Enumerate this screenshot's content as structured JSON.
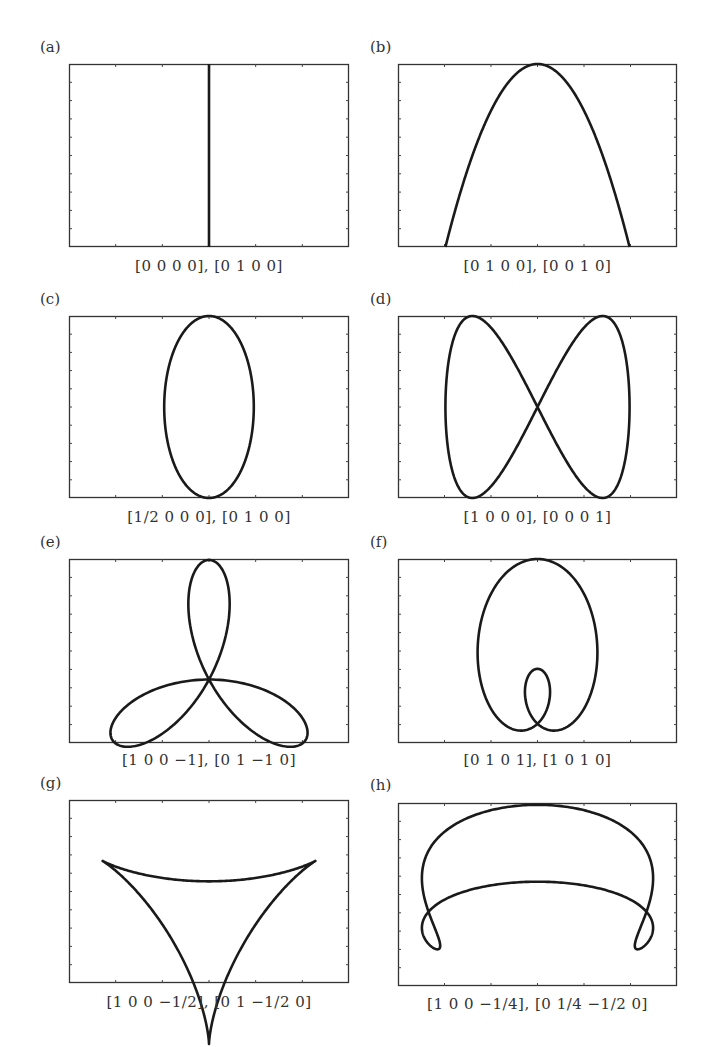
{
  "figure": {
    "panels": [
      {
        "id": "a",
        "label": "(a)",
        "caption": "[0 0 0 0], [0 1 0 0]"
      },
      {
        "id": "b",
        "label": "(b)",
        "caption": "[0 1 0 0], [0 0 1 0]"
      },
      {
        "id": "c",
        "label": "(c)",
        "caption": "[1/2 0 0 0], [0 1 0 0]"
      },
      {
        "id": "d",
        "label": "(d)",
        "caption": "[1 0 0 0], [0 0 0 1]"
      },
      {
        "id": "e",
        "label": "(e)",
        "caption": "[1 0 0 −1], [0 1 −1 0]"
      },
      {
        "id": "f",
        "label": "(f)",
        "caption": "[0 1 0 1], [1 0 1 0]"
      },
      {
        "id": "g",
        "label": "(g)",
        "caption": "[1 0 0 −1/2], [0 1 −1/2 0]"
      },
      {
        "id": "h",
        "label": "(h)",
        "caption": "[1 0 0 −1/4], [0 1/4 −1/2 0]"
      }
    ]
  },
  "chart_data": [
    {
      "type": "line",
      "panel": "(a)",
      "title": "",
      "xlabel": "[0 0 0 0], [0 1 0 0]",
      "ylabel": "",
      "x_coeffs": [
        0,
        0,
        0,
        0
      ],
      "y_coeffs": [
        0,
        1,
        0,
        0
      ],
      "shape": "vertical line at center",
      "xlim": [
        -1,
        1
      ],
      "ylim": [
        -1,
        1
      ],
      "grid": false,
      "tick_labels": "none"
    },
    {
      "type": "line",
      "panel": "(b)",
      "title": "",
      "xlabel": "[0 1 0 0], [0 0 1 0]",
      "ylabel": "",
      "x_coeffs": [
        0,
        1,
        0,
        0
      ],
      "y_coeffs": [
        0,
        0,
        1,
        0
      ],
      "shape": "parabola opening downward",
      "grid": false,
      "tick_labels": "none"
    },
    {
      "type": "line",
      "panel": "(c)",
      "title": "",
      "xlabel": "[1/2 0 0 0], [0 1 0 0]",
      "ylabel": "",
      "x_coeffs": [
        0.5,
        0,
        0,
        0
      ],
      "y_coeffs": [
        0,
        1,
        0,
        0
      ],
      "shape": "vertical ellipse",
      "grid": false,
      "tick_labels": "none"
    },
    {
      "type": "line",
      "panel": "(d)",
      "title": "",
      "xlabel": "[1 0 0 0], [0 0 0 1]",
      "ylabel": "",
      "x_coeffs": [
        1,
        0,
        0,
        0
      ],
      "y_coeffs": [
        0,
        0,
        0,
        1
      ],
      "shape": "figure-eight (Lissajous)",
      "grid": false,
      "tick_labels": "none"
    },
    {
      "type": "line",
      "panel": "(e)",
      "title": "",
      "xlabel": "[1 0 0 −1], [0 1 −1 0]",
      "ylabel": "",
      "x_coeffs": [
        1,
        0,
        0,
        -1
      ],
      "y_coeffs": [
        0,
        1,
        -1,
        0
      ],
      "shape": "three-leaf rose (trefoil)",
      "grid": false,
      "tick_labels": "none"
    },
    {
      "type": "line",
      "panel": "(f)",
      "title": "",
      "xlabel": "[0 1 0 1], [1 0 1 0]",
      "ylabel": "",
      "x_coeffs": [
        0,
        1,
        0,
        1
      ],
      "y_coeffs": [
        1,
        0,
        1,
        0
      ],
      "shape": "limacon with inner loop",
      "grid": false,
      "tick_labels": "none"
    },
    {
      "type": "line",
      "panel": "(g)",
      "title": "",
      "xlabel": "[1 0 0 −1/2], [0 1 −1/2 0]",
      "ylabel": "",
      "x_coeffs": [
        1,
        0,
        0,
        -0.5
      ],
      "y_coeffs": [
        0,
        1,
        -0.5,
        0
      ],
      "shape": "deltoid (three-cusped hypocycloid)",
      "grid": false,
      "tick_labels": "none"
    },
    {
      "type": "line",
      "panel": "(h)",
      "title": "",
      "xlabel": "[1 0 0 −1/4], [0 1/4 −1/2 0]",
      "ylabel": "",
      "x_coeffs": [
        1,
        0,
        0,
        -0.25
      ],
      "y_coeffs": [
        0,
        0.25,
        -0.5,
        0
      ],
      "shape": "self-intersecting curve with two side loops",
      "grid": false,
      "tick_labels": "none"
    }
  ]
}
